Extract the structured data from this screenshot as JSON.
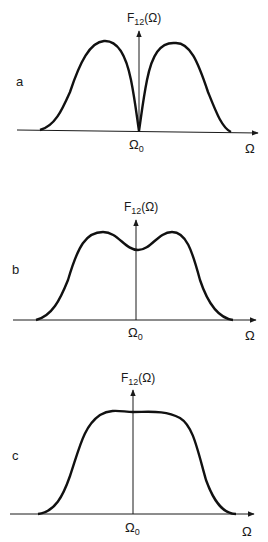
{
  "figure": {
    "panels": [
      {
        "id": "a",
        "label": "a",
        "y_axis_label": "F12(Ω)",
        "y_axis_label_main": "F",
        "y_axis_label_sub": "12",
        "y_axis_label_arg": "(Ω)",
        "center_tick_label": "Ω0",
        "center_tick_main": "Ω",
        "center_tick_sub": "0",
        "x_axis_label": "Ω",
        "shape": "double peak with zero dip at Ω0"
      },
      {
        "id": "b",
        "label": "b",
        "y_axis_label": "F12(Ω)",
        "y_axis_label_main": "F",
        "y_axis_label_sub": "12",
        "y_axis_label_arg": "(Ω)",
        "center_tick_label": "Ω0",
        "center_tick_main": "Ω",
        "center_tick_sub": "0",
        "x_axis_label": "Ω",
        "shape": "double peak with shallow dip at Ω0"
      },
      {
        "id": "c",
        "label": "c",
        "y_axis_label": "F12(Ω)",
        "y_axis_label_main": "F",
        "y_axis_label_sub": "12",
        "y_axis_label_arg": "(Ω)",
        "center_tick_label": "Ω0",
        "center_tick_main": "Ω",
        "center_tick_sub": "0",
        "x_axis_label": "Ω",
        "shape": "single flat-topped peak centered at Ω0"
      }
    ]
  }
}
